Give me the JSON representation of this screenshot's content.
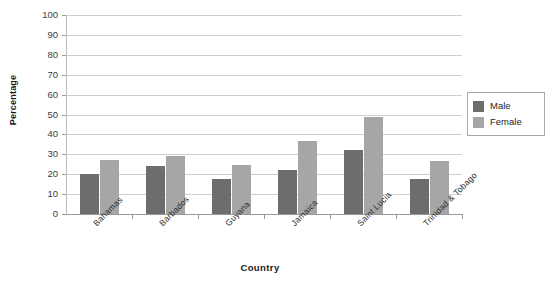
{
  "chart_data": {
    "type": "bar",
    "title": "",
    "xlabel": "Country",
    "ylabel": "Percentage",
    "categories": [
      "Bahamas",
      "Barbados",
      "Guyana",
      "Jamaica",
      "Saint Lucia",
      "Trinidad & Tobago"
    ],
    "series": [
      {
        "name": "Male",
        "color": "#6d6d6d",
        "values": [
          20,
          24,
          17.5,
          22,
          32,
          17.5
        ]
      },
      {
        "name": "Female",
        "color": "#a6a6a6",
        "values": [
          27,
          29,
          24.5,
          36.5,
          49,
          26.5
        ]
      }
    ],
    "ylim": [
      0,
      100
    ],
    "yticks": [
      0,
      10,
      20,
      30,
      40,
      50,
      60,
      70,
      80,
      90,
      100
    ],
    "ytick_labels": [
      "0",
      "10",
      "20",
      "30",
      "40",
      "50",
      "60",
      "70",
      "80",
      "90",
      "100"
    ],
    "grid": true,
    "legend_position": "right"
  },
  "legend": {
    "items": [
      {
        "label": "Male"
      },
      {
        "label": "Female"
      }
    ]
  }
}
